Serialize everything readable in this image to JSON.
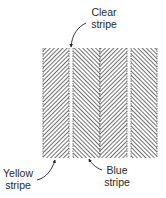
{
  "labels": {
    "clear": {
      "line1": "Clear",
      "line2": "stripe"
    },
    "yellow": {
      "line1": "Yellow",
      "line2": "stripe"
    },
    "blue": {
      "line1": "Blue",
      "line2": "stripe"
    }
  },
  "stripes": [
    {
      "name": "yellow-stripe",
      "x": 43,
      "width": 26,
      "hatch": "forward"
    },
    {
      "name": "blue-stripe",
      "x": 73,
      "width": 27,
      "hatch": "back"
    },
    {
      "name": "yellow-stripe",
      "x": 100,
      "width": 27,
      "hatch": "forward"
    },
    {
      "name": "blue-stripe",
      "x": 131,
      "width": 26,
      "hatch": "back"
    }
  ],
  "colors": {
    "ink": "#2a2a2a",
    "background": "#ffffff"
  }
}
